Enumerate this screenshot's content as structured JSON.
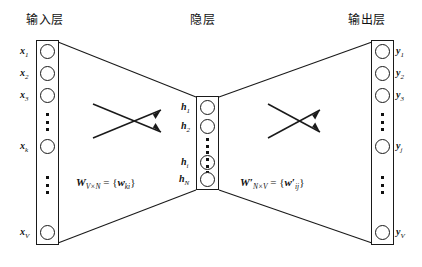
{
  "figure": {
    "type": "neural-network-diagram"
  },
  "titles": {
    "input": "输入层",
    "hidden": "隐层",
    "output": "输出层"
  },
  "layers": {
    "input": {
      "name": "input-layer",
      "nodes": [
        {
          "label": "x",
          "sub": "1"
        },
        {
          "label": "x",
          "sub": "2"
        },
        {
          "label": "x",
          "sub": "3"
        },
        {
          "label": "x",
          "sub": "k"
        },
        {
          "label": "x",
          "sub": "V"
        }
      ]
    },
    "hidden": {
      "name": "hidden-layer",
      "nodes": [
        {
          "label": "h",
          "sub": "1"
        },
        {
          "label": "h",
          "sub": "2"
        },
        {
          "label": "h",
          "sub": "i"
        },
        {
          "label": "h",
          "sub": "N"
        }
      ]
    },
    "output": {
      "name": "output-layer",
      "nodes": [
        {
          "label": "y",
          "sub": "1"
        },
        {
          "label": "y",
          "sub": "2"
        },
        {
          "label": "y",
          "sub": "3"
        },
        {
          "label": "y",
          "sub": "j"
        },
        {
          "label": "y",
          "sub": "V"
        }
      ]
    }
  },
  "weights": {
    "left": {
      "symbol": "W",
      "prime": "",
      "dims": "V×N",
      "element": "w",
      "element_prime": "",
      "element_sub": "ki"
    },
    "right": {
      "symbol": "W",
      "prime": "′",
      "dims": "N×V",
      "element": "w",
      "element_prime": "′",
      "element_sub": "ij"
    }
  },
  "colors": {
    "stroke": "#1a1a1a",
    "background": "#ffffff",
    "text": "#111111"
  }
}
